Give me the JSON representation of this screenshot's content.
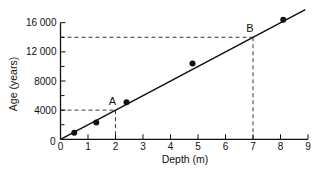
{
  "chart_data": {
    "type": "scatter",
    "title": "",
    "xlabel": "Depth (m)",
    "ylabel": "Age (years)",
    "xlim": [
      0,
      9
    ],
    "ylim": [
      0,
      16000
    ],
    "grid": false,
    "legend": null,
    "x_ticks": [
      0,
      1,
      2,
      3,
      4,
      5,
      6,
      7,
      8,
      9
    ],
    "x_tick_labels": [
      "0",
      "1",
      "2",
      "3",
      "4",
      "5",
      "6",
      "7",
      "8",
      "9"
    ],
    "y_ticks_major": [
      0,
      4000,
      8000,
      12000,
      16000
    ],
    "y_tick_labels": [
      "0",
      "4000",
      "8000",
      "12 000",
      "16 000"
    ],
    "y_ticks_minor": [
      2000,
      6000,
      10000,
      14000
    ],
    "series": [
      {
        "name": "measured samples",
        "kind": "points",
        "x": [
          0.5,
          1.3,
          2.4,
          4.8,
          8.1
        ],
        "y": [
          900,
          2300,
          5100,
          10400,
          16400
        ]
      },
      {
        "name": "best-fit line",
        "kind": "line",
        "x": [
          0,
          8.9
        ],
        "y": [
          0,
          17800
        ]
      }
    ],
    "annotations": [
      {
        "label": "A",
        "x": 2,
        "y": 4000,
        "style": "dashed guide lines to both axes"
      },
      {
        "label": "B",
        "x": 7,
        "y": 14000,
        "style": "dashed guide lines to both axes"
      }
    ]
  }
}
